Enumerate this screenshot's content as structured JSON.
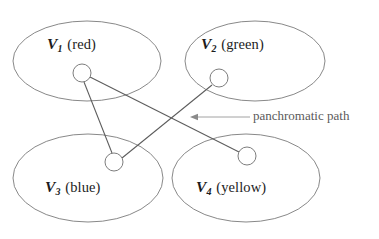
{
  "figure": {
    "kind": "venn-style grouped graph diagram",
    "background_color": "#ffffff",
    "ellipse_stroke_color": "#7b7b7b",
    "edge_stroke_color": "#5c5c5c",
    "node_stroke_color": "#6e6e6e",
    "annotation_color": "#8a8a8a"
  },
  "groups": [
    {
      "id": "v1",
      "symbol": "V",
      "subscript": "1",
      "color_name": "(red)",
      "full_label": "V1 (red)"
    },
    {
      "id": "v2",
      "symbol": "V",
      "subscript": "2",
      "color_name": "(green)",
      "full_label": "V2 (green)"
    },
    {
      "id": "v3",
      "symbol": "V",
      "subscript": "3",
      "color_name": "(blue)",
      "full_label": "V3 (blue)"
    },
    {
      "id": "v4",
      "symbol": "V",
      "subscript": "4",
      "color_name": "(yellow)",
      "full_label": "V4 (yellow)"
    }
  ],
  "annotation": {
    "label": "panchromatic path",
    "arrow_direction": "left"
  },
  "nodes": [
    {
      "id": "n1",
      "group": "v1",
      "cx": 82,
      "cy": 73,
      "r": 9
    },
    {
      "id": "n2",
      "group": "v2",
      "cx": 219,
      "cy": 78,
      "r": 9
    },
    {
      "id": "n3",
      "group": "v3",
      "cx": 114,
      "cy": 162,
      "r": 9
    },
    {
      "id": "n4",
      "group": "v4",
      "cx": 247,
      "cy": 156,
      "r": 9
    }
  ],
  "edges": [
    {
      "id": "e13",
      "from": "n1",
      "to": "n3"
    },
    {
      "id": "e14",
      "from": "n1",
      "to": "n4"
    },
    {
      "id": "e23",
      "from": "n2",
      "to": "n3"
    }
  ]
}
